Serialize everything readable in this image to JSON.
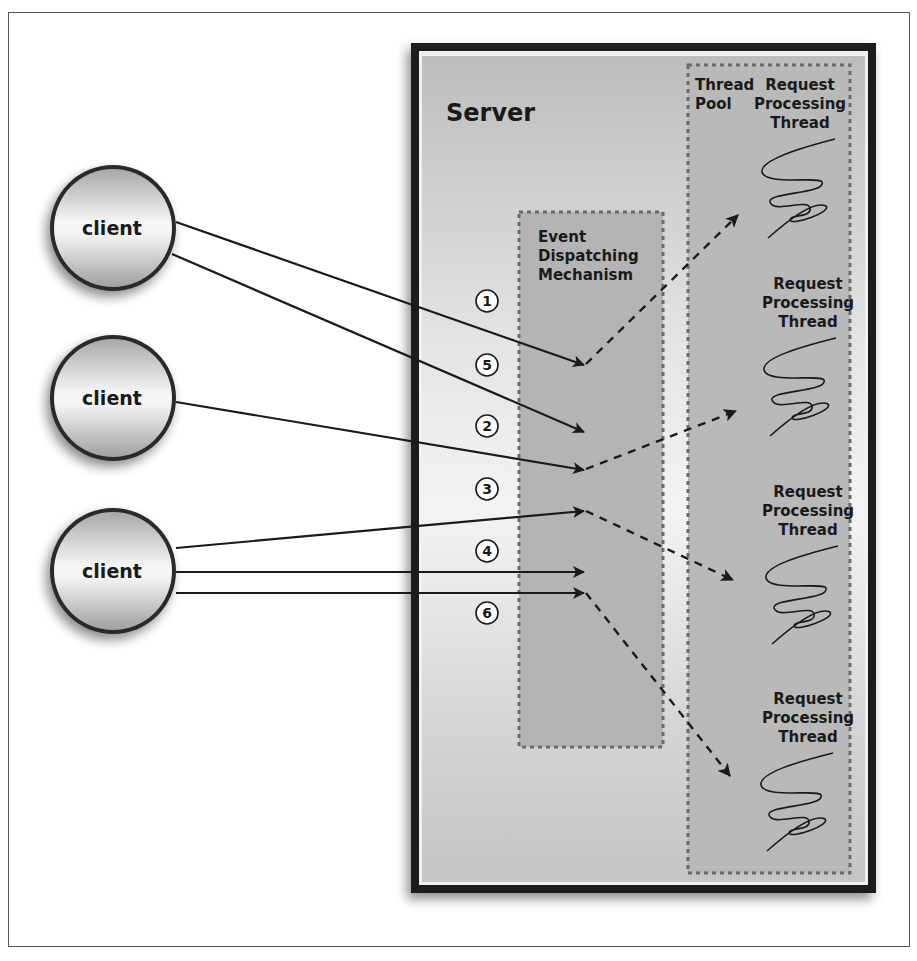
{
  "diagram": {
    "server": {
      "title": "Server"
    },
    "dispatcher": {
      "label_lines": [
        "Event",
        "Dispatching",
        "Mechanism"
      ]
    },
    "thread_pool": {
      "label_lines": [
        "Thread",
        "Pool"
      ],
      "threads": [
        {
          "label_lines": [
            "Request",
            "Processing",
            "Thread"
          ]
        },
        {
          "label_lines": [
            "Request",
            "Processing",
            "Thread"
          ]
        },
        {
          "label_lines": [
            "Request",
            "Processing",
            "Thread"
          ]
        },
        {
          "label_lines": [
            "Request",
            "Processing",
            "Thread"
          ]
        }
      ]
    },
    "clients": [
      {
        "label": "client"
      },
      {
        "label": "client"
      },
      {
        "label": "client"
      }
    ],
    "steps": [
      "1",
      "5",
      "2",
      "3",
      "4",
      "6"
    ],
    "colors": {
      "frame": "#555555",
      "server_border": "#1a1a1a",
      "server_fill": "#c8c8c8",
      "region_fill": "#b3b3b3",
      "dotted": "#6a6a6a",
      "arrow": "#1a1a1a"
    }
  }
}
